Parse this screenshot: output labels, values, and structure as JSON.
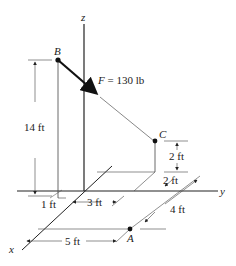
{
  "figure": {
    "axes": {
      "x": "x",
      "y": "y",
      "z": "z"
    },
    "points": {
      "A": "A",
      "B": "B",
      "C": "C"
    },
    "force": {
      "symbol": "F",
      "equals": " = 130 lb",
      "magnitude": 130,
      "unit": "lb"
    },
    "dimensions": {
      "height_B": "14 ft",
      "offset_B": "1 ft",
      "dist_3": "3 ft",
      "dist_5": "5 ft",
      "dist_4": "4 ft",
      "height_C": "2 ft",
      "offset_C": "2 ft"
    },
    "colors": {
      "line": "#222222",
      "thin": "#555555",
      "background": "#ffffff"
    }
  }
}
